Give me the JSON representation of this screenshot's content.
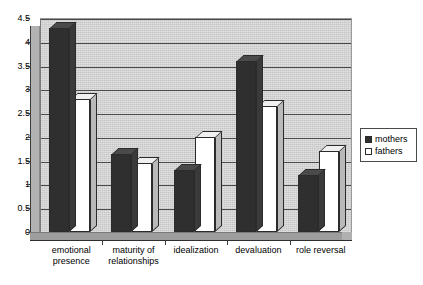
{
  "chart_data": {
    "type": "bar",
    "title": "",
    "xlabel": "",
    "ylabel": "",
    "ylim": [
      0,
      4.5
    ],
    "ytick_labels": [
      "4.5",
      "4",
      "3.5",
      "3",
      "2.5",
      "2",
      "1.5",
      "1",
      "0.5",
      "0"
    ],
    "ytick_values": [
      4.5,
      4,
      3.5,
      3,
      2.5,
      2,
      1.5,
      1,
      0.5,
      0
    ],
    "grid": true,
    "legend_position": "right",
    "three_d": true,
    "categories": [
      "emotional presence",
      "maturity of relationships",
      "idealization",
      "devaluation",
      "role reversal"
    ],
    "category_lines": [
      [
        "emotional",
        "presence"
      ],
      [
        "maturity of",
        "relationships"
      ],
      [
        "idealization",
        ""
      ],
      [
        "devaluation",
        ""
      ],
      [
        "role reversal",
        ""
      ]
    ],
    "series": [
      {
        "name": "mothers",
        "color": "#2f2f2f",
        "values": [
          4.3,
          1.65,
          1.3,
          3.6,
          1.2
        ]
      },
      {
        "name": "fathers",
        "color": "#ffffff",
        "values": [
          2.8,
          1.45,
          2.0,
          2.65,
          1.7
        ]
      }
    ]
  },
  "legend": {
    "items": [
      {
        "label": "mothers",
        "style": "mothers"
      },
      {
        "label": "fathers",
        "style": "fathers"
      }
    ]
  },
  "colors": {
    "plot_background": "#c6c6c6",
    "mothers": "#2f2f2f",
    "fathers": "#ffffff",
    "gridline": "#4a4a4a",
    "axis": "#2e2e2e"
  }
}
